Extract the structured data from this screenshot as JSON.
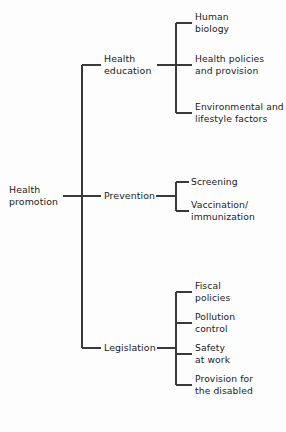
{
  "diagram": {
    "title": "Health promotion",
    "type": "tree-diagram",
    "orientation": "left-to-right",
    "line_color": "#3a3a3a",
    "text_color": "#1b1b1b",
    "background_color": "#fdfdfd",
    "root": {
      "label": "Health\npromotion"
    },
    "branches": [
      {
        "label": "Health\neducation",
        "children": [
          {
            "label": "Human\nbiology"
          },
          {
            "label": "Health policies\nand provision"
          },
          {
            "label": "Environmental and\nlifestyle factors"
          }
        ]
      },
      {
        "label": "Prevention",
        "children": [
          {
            "label": "Screening"
          },
          {
            "label": "Vaccination/\nimmunization"
          }
        ]
      },
      {
        "label": "Legislation",
        "children": [
          {
            "label": "Fiscal\npolicies"
          },
          {
            "label": "Pollution\ncontrol"
          },
          {
            "label": "Safety\nat work"
          },
          {
            "label": "Provision for\nthe disabled"
          }
        ]
      }
    ]
  }
}
